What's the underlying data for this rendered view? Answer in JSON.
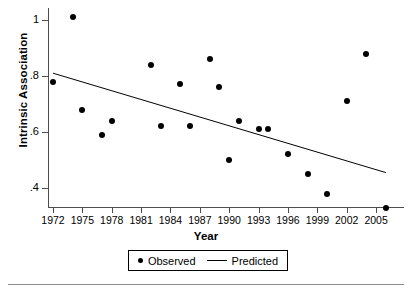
{
  "chart_data": {
    "type": "scatter",
    "title": "",
    "xlabel": "Year",
    "ylabel": "Intrinsic Association",
    "xlim": [
      1971,
      2007
    ],
    "ylim": [
      0.3,
      1.05
    ],
    "grid": false,
    "legend_position": "bottom-center",
    "x_ticks": [
      "1972",
      "1975",
      "1978",
      "1981",
      "1984",
      "1987",
      "1990",
      "1993",
      "1996",
      "1999",
      "2002",
      "2005"
    ],
    "x_tick_values": [
      1972,
      1975,
      1978,
      1981,
      1984,
      1987,
      1990,
      1993,
      1996,
      1999,
      2002,
      2005
    ],
    "y_ticks": [
      "1",
      ".8",
      ".6",
      ".4"
    ],
    "y_tick_values": [
      1.0,
      0.8,
      0.6,
      0.4
    ],
    "series": [
      {
        "name": "Observed",
        "type": "scatter",
        "marker": "filled-circle",
        "color": "#000000",
        "x": [
          1972,
          1974,
          1975,
          1977,
          1978,
          1982,
          1983,
          1985,
          1986,
          1988,
          1989,
          1990,
          1991,
          1993,
          1994,
          1996,
          1998,
          2000,
          2002,
          2004,
          2006
        ],
        "y": [
          0.78,
          1.01,
          0.68,
          0.59,
          0.64,
          0.84,
          0.62,
          0.77,
          0.62,
          0.86,
          0.76,
          0.5,
          0.64,
          0.61,
          0.61,
          0.52,
          0.45,
          0.38,
          0.71,
          0.88,
          0.33
        ]
      },
      {
        "name": "Predicted",
        "type": "line",
        "color": "#000000",
        "x": [
          1972,
          2006
        ],
        "y": [
          0.81,
          0.455
        ]
      }
    ]
  },
  "legend": {
    "observed_label": "Observed",
    "predicted_label": "Predicted"
  },
  "axes": {
    "x_title": "Year",
    "y_title": "Intrinsic Association"
  }
}
